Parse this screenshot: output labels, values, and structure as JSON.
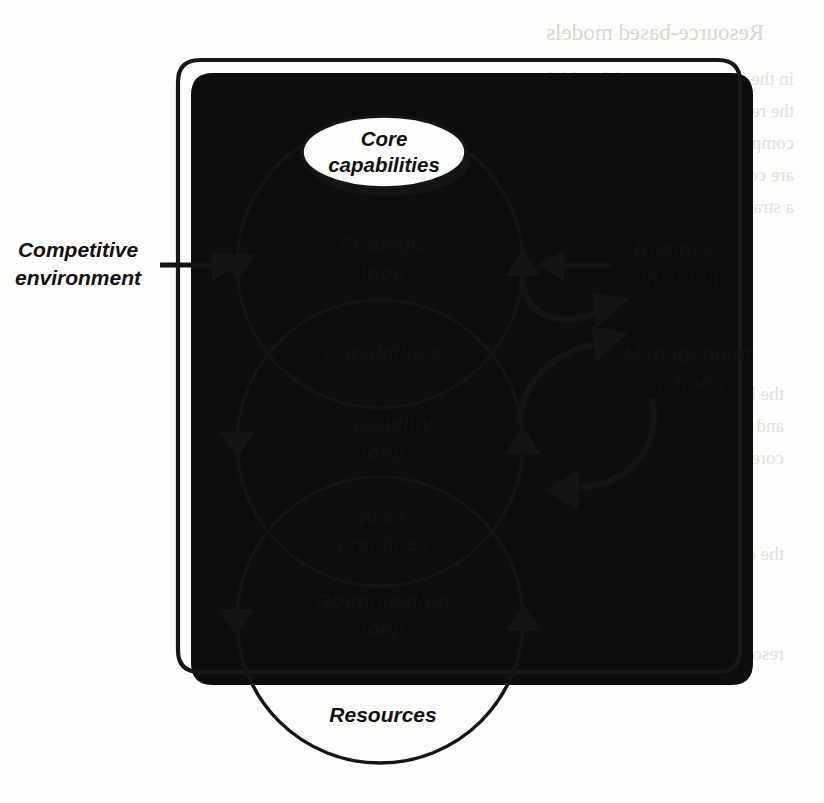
{
  "figure": {
    "name": "resource-based-model-loops",
    "type": "diagram",
    "frame": {
      "shape": "rounded-rectangle",
      "has_drop_shadow": true,
      "shadow_color": "#0d0d0d"
    },
    "loops": [
      {
        "id": "strategic",
        "label": "Strategic\nloop",
        "label_line1": "Strategic",
        "label_line2": "loop"
      },
      {
        "id": "capability",
        "label": "Capability\nloop",
        "label_line1": "Capability",
        "label_line2": "loop"
      },
      {
        "id": "routinisation",
        "label": "Routinisation\nloop",
        "label_line1": "Routinisation",
        "label_line2": "loop"
      }
    ],
    "nodes": [
      {
        "id": "core-capabilities",
        "shape": "ellipse",
        "shadowed": true,
        "label_line1": "Core",
        "label_line2": "capabilities"
      },
      {
        "id": "capabilities",
        "shape": "lens-overlap",
        "label_line1": "Capabilities",
        "label_line2": ""
      },
      {
        "id": "work-practices",
        "shape": "lens-overlap",
        "label_line1": "Work",
        "label_line2": "practices"
      },
      {
        "id": "resources",
        "shape": "circle-bottom",
        "label_line1": "Resources",
        "label_line2": ""
      }
    ],
    "external_labels": [
      {
        "id": "competitive-environment",
        "line1": "Competitive",
        "line2": "environment",
        "side": "left",
        "arrow": "right"
      },
      {
        "id": "business-mission",
        "line1": "Business",
        "line2": "mission",
        "side": "right",
        "arrow": "left"
      },
      {
        "id": "management-actions",
        "line1": "Management",
        "line2": "actions",
        "side": "right",
        "arrow": "curved"
      }
    ],
    "colors": {
      "ink": "#141414",
      "shadow": "#0d0d0d",
      "paper": "#fdfdfc",
      "bleed_through": "#cfcbc4"
    }
  },
  "bleed_through_text": {
    "heading": "Resource-based models",
    "lines": [
      "illegible reverse-side text",
      "illegible reverse-side text",
      "illegible reverse-side text",
      "illegible reverse-side text",
      "illegible reverse-side text"
    ]
  }
}
